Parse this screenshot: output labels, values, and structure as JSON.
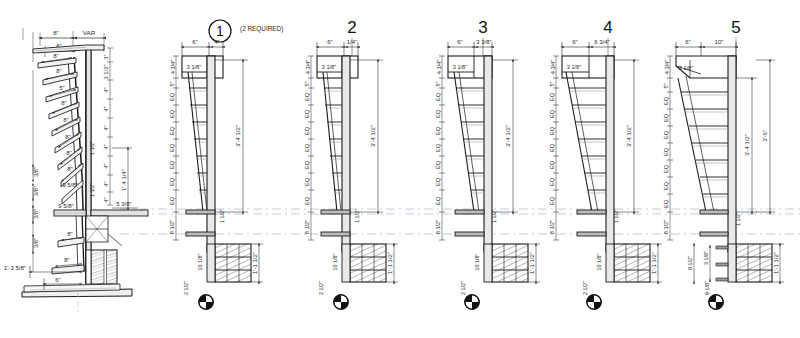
{
  "sheet": {
    "title_absent": "",
    "background_color": "#ffffff",
    "line_color": "#1a1a1a",
    "guide_color": "#b9c6d6",
    "hatch_color": "#6d6d6d",
    "concrete_fill": "#8d8d8d"
  },
  "section_detail": {
    "name": "stair-section-elevation",
    "top_dims": [
      "8\"",
      "VAR",
      "6\""
    ],
    "tread_labels": [
      "8\"",
      "8\"",
      "8\"",
      "8\"",
      "8\"",
      "8\"",
      "8\"",
      "9 5/8\"",
      "8\"",
      "8\""
    ],
    "riser_note_1": "5\"",
    "right_riser_dims": [
      "3\"",
      "3 1/2\"",
      "4\"",
      "4\"",
      "4\"",
      "4\"",
      "4\"",
      "4\"",
      "4\""
    ],
    "right_overall": "1'-4 1/4\"",
    "right_sub": "5 3/8\"",
    "mid_thickness": [
      "1 1/2\"",
      "1 1/2\""
    ],
    "left_small_dims": [
      "3/8\"",
      "3/8\"",
      "3/8\"",
      "3/8\""
    ],
    "bottom_dims": [
      "1'-3 5/8\"",
      "6\""
    ],
    "landing_note": "9 5/8\""
  },
  "details": [
    {
      "number": "1",
      "note": "(2 REQUIRED)",
      "top_left_dim": "6\"",
      "top_right_dim": "4\"",
      "head_h_dim": "4 3/4\"",
      "head_w_dim": "3 1/8\"",
      "riser_first": "5\"",
      "eq_label": "EQ",
      "eq_count": 7,
      "bottom_riser": "8 1/2\"",
      "right_overall": "3'-4 1/2\"",
      "plate_thk": "1 1/2\"",
      "base_height": "1'-1 1/2\"",
      "base_left_dim": "10 1/8\"",
      "base_bottom_dim": "2 1/2\"",
      "compass": "quadrant-compass"
    },
    {
      "number": "2",
      "note": "",
      "top_left_dim": "6\"",
      "top_right_dim": "1/4\"",
      "head_h_dim": "4 3/4\"",
      "head_w_dim": "3 1/8\"",
      "riser_first": "5\"",
      "eq_label": "EQ",
      "eq_count": 7,
      "bottom_riser": "8 1/2\"",
      "right_overall": "3'-4 1/2\"",
      "plate_thk": "1 1/2\"",
      "base_height": "1'-1 1/2\"",
      "base_left_dim": "10 1/8\"",
      "base_bottom_dim": "2 1/2\"",
      "compass": "quadrant-compass"
    },
    {
      "number": "3",
      "note": "",
      "top_left_dim": "6\"",
      "top_right_dim": "3 3/8\"",
      "head_h_dim": "4 3/4\"",
      "head_w_dim": "3 1/8\"",
      "riser_first": "5\"",
      "eq_label": "EQ",
      "eq_count": 7,
      "bottom_riser": "8 1/2\"",
      "right_overall": "3'-4 1/2\"",
      "plate_thk": "1 1/2\"",
      "base_height": "1'-1 1/2\"",
      "base_left_dim": "10 1/8\"",
      "base_bottom_dim": "2 1/2\"",
      "compass": "quadrant-compass"
    },
    {
      "number": "4",
      "note": "",
      "top_left_dim": "6\"",
      "top_right_dim": "6 3/4\"",
      "head_h_dim": "4 3/4\"",
      "head_w_dim": "3 1/8\"",
      "riser_first": "5\"",
      "eq_label": "EQ",
      "eq_count": 7,
      "bottom_riser": "8 1/2\"",
      "right_overall": "3'-4 1/2\"",
      "plate_thk": "1 1/2\"",
      "base_height": "1'-1 1/2\"",
      "base_left_dim": "10 1/8\"",
      "base_bottom_dim": "2 1/2\"",
      "compass": "quadrant-compass"
    },
    {
      "number": "5",
      "note": "",
      "top_left_dim": "6\"",
      "top_right_dim": "10\"",
      "head_h_dim": "4 3/4\"",
      "head_w_dim": "3 1/8\"",
      "riser_first": "5\"",
      "eq_label": "EQ",
      "eq_count": 7,
      "bottom_riser": "8 1/2\"",
      "right_overall": "3'-4 1/2\"",
      "right_overall_2": "3'-6\"",
      "plate_thk": "1 1/2\"",
      "base_height": "1'-1 1/2\"",
      "base_left_dim": "9 1/8\"",
      "base_bottom_dim": "2 1/2\"",
      "base_mid_dim": "3 1/8\"",
      "base_col_dim": "8 1/2\"",
      "compass": "quadrant-compass"
    }
  ]
}
